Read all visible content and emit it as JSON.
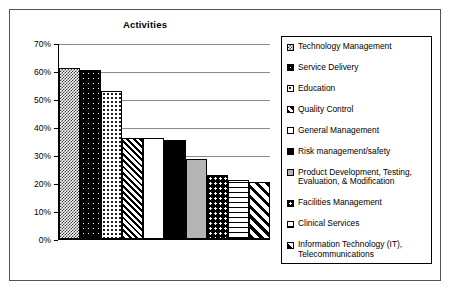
{
  "chart_data": {
    "type": "bar",
    "title": "Activities",
    "xlabel": "",
    "ylabel": "",
    "ylim": [
      0,
      70
    ],
    "grid": true,
    "legend_position": "right",
    "ytick_labels": [
      "70%",
      "60%",
      "50%",
      "40%",
      "30%",
      "20%",
      "10%",
      "0%"
    ],
    "ytick_values": [
      70,
      60,
      50,
      40,
      30,
      20,
      10,
      0
    ],
    "categories": [
      "Technology Management",
      "Service Delivery",
      "Education",
      "Quality Control",
      "General Management",
      "Risk management/safety",
      "Product Development, Testing, Evaluation, & Modification",
      "Facilities Management",
      "Clinical Services",
      "Information Technology (IT), Telecommunications"
    ],
    "values": [
      61,
      60.5,
      53,
      36,
      36,
      35.5,
      28.5,
      23,
      21,
      20.5
    ],
    "series": [
      {
        "name": "Activities",
        "values": [
          61,
          60.5,
          53,
          36,
          36,
          35.5,
          28.5,
          23,
          21,
          20.5
        ]
      }
    ]
  },
  "legend": {
    "items": [
      {
        "label": "Technology Management",
        "pattern": "p-checker-dark"
      },
      {
        "label": "Service Delivery",
        "pattern": "p-black-dots"
      },
      {
        "label": "Education",
        "pattern": "p-white-dots"
      },
      {
        "label": "Quality Control",
        "pattern": "p-diag-dense"
      },
      {
        "label": "General Management",
        "pattern": "p-plain-white"
      },
      {
        "label": "Risk management/safety",
        "pattern": "p-solid-black"
      },
      {
        "label": "Product Development, Testing,\nEvaluation, & Modification",
        "pattern": "p-gray"
      },
      {
        "label": "Facilities Management",
        "pattern": "p-black-dots-lg"
      },
      {
        "label": "Clinical Services",
        "pattern": "p-hlines"
      },
      {
        "label": "Information Technology (IT),\nTelecommunications",
        "pattern": "p-diag-wide"
      }
    ]
  },
  "colors": {
    "axis": "#000000",
    "gridline": "#8a8a8a",
    "frame": "#555555",
    "background": "#ffffff",
    "gray_fill": "#b5b5b5"
  }
}
